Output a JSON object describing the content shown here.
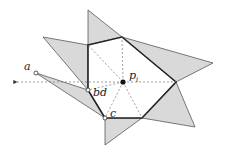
{
  "diagram": {
    "labels": {
      "a": "a",
      "bd": "bd",
      "c": "c",
      "p": "p",
      "p_sub": "i"
    },
    "colors": {
      "fill": "#d9d9d9",
      "stroke": "#444444",
      "bold": "#222222",
      "dashed": "#777777"
    },
    "center": [
      123,
      82
    ],
    "hexagon": [
      [
        88,
        45
      ],
      [
        122,
        37
      ],
      [
        176,
        82
      ],
      [
        142,
        118
      ],
      [
        105,
        118
      ],
      [
        88,
        90
      ]
    ],
    "triangles": [
      [
        [
          88,
          10
        ],
        [
          88,
          45
        ],
        [
          122,
          37
        ]
      ],
      [
        [
          43,
          37
        ],
        [
          88,
          45
        ],
        [
          88,
          90
        ]
      ],
      [
        [
          36,
          73
        ],
        [
          88,
          90
        ],
        [
          105,
          118
        ]
      ],
      [
        [
          105,
          118
        ],
        [
          105,
          145
        ],
        [
          142,
          118
        ]
      ],
      [
        [
          122,
          37
        ],
        [
          213,
          63
        ],
        [
          176,
          82
        ]
      ],
      [
        [
          176,
          82
        ],
        [
          195,
          127
        ],
        [
          142,
          118
        ]
      ]
    ],
    "points": {
      "a": [
        36,
        73
      ],
      "bd": [
        88,
        90
      ],
      "c": [
        105,
        118
      ]
    }
  }
}
